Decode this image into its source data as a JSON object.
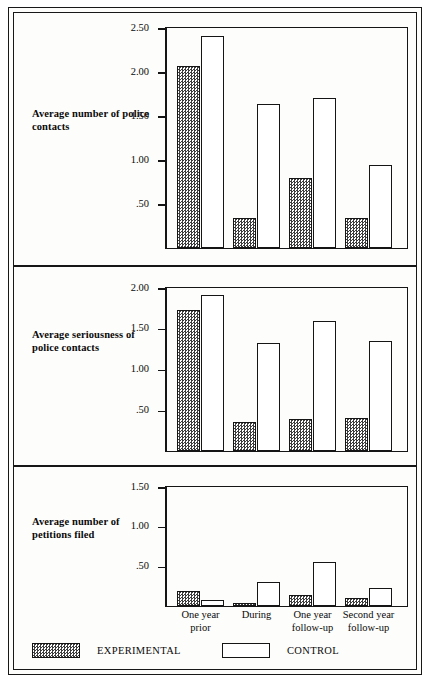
{
  "chart_data": [
    {
      "type": "bar",
      "title": "",
      "panel_label": "Average\nnumber of\npolice  contacts",
      "ylabel": "Average number of police contacts",
      "xlabel": "",
      "categories": [
        "One year\nprior",
        "During",
        "One year\nfollow-up",
        "Second year\nfollow-up"
      ],
      "ytick_labels": [
        "2.50",
        "2.00",
        "1.50",
        "1.00",
        ".50"
      ],
      "ytick_values": [
        2.5,
        2.0,
        1.5,
        1.0,
        0.5
      ],
      "ylim": [
        0,
        2.5
      ],
      "grid": false,
      "legend_position": "bottom",
      "series": [
        {
          "name": "EXPERIMENTAL",
          "values": [
            2.06,
            0.33,
            0.79,
            0.33
          ]
        },
        {
          "name": "CONTROL",
          "values": [
            2.4,
            1.63,
            1.7,
            0.94
          ]
        }
      ]
    },
    {
      "type": "bar",
      "title": "",
      "panel_label": "Average\nseriousness\nof police\ncontacts",
      "ylabel": "Average seriousness of police contacts",
      "xlabel": "",
      "categories": [
        "One year\nprior",
        "During",
        "One year\nfollow-up",
        "Second year\nfollow-up"
      ],
      "ytick_labels": [
        "2.00",
        "1.50",
        "1.00",
        ".50"
      ],
      "ytick_values": [
        2.0,
        1.5,
        1.0,
        0.5
      ],
      "ylim": [
        0,
        2.0
      ],
      "grid": false,
      "legend_position": "bottom",
      "series": [
        {
          "name": "EXPERIMENTAL",
          "values": [
            1.72,
            0.35,
            0.38,
            0.4
          ]
        },
        {
          "name": "CONTROL",
          "values": [
            1.9,
            1.31,
            1.59,
            1.34
          ]
        }
      ]
    },
    {
      "type": "bar",
      "title": "",
      "panel_label": "Average\nnumber of\npetitions\nfiled",
      "ylabel": "Average number of petitions filed",
      "xlabel": "",
      "categories": [
        "One year\nprior",
        "During",
        "One year\nfollow-up",
        "Second year\nfollow-up"
      ],
      "ytick_labels": [
        "1.50",
        "1.00",
        ".50"
      ],
      "ytick_values": [
        1.5,
        1.0,
        0.5
      ],
      "ylim": [
        0,
        1.5
      ],
      "grid": false,
      "legend_position": "bottom",
      "series": [
        {
          "name": "EXPERIMENTAL",
          "values": [
            0.18,
            0.03,
            0.13,
            0.1
          ]
        },
        {
          "name": "CONTROL",
          "values": [
            0.07,
            0.3,
            0.54,
            0.22
          ]
        }
      ]
    }
  ],
  "panels": [
    {
      "label": "Average\nnumber of\npolice  contacts"
    },
    {
      "label": "Average\nseriousness\nof police\ncontacts"
    },
    {
      "label": "Average\nnumber of\npetitions\nfiled"
    }
  ],
  "axis": {
    "categories": [
      "One year\nprior",
      "During",
      "One year\nfollow-up",
      "Second year\nfollow-up"
    ]
  },
  "legend": {
    "items": [
      {
        "label": "EXPERIMENTAL",
        "fill": "hatched",
        "color": "#3d3d3d"
      },
      {
        "label": "CONTROL",
        "fill": "solid",
        "color": "#ffffff"
      }
    ]
  },
  "colors": {
    "ink": "#151515",
    "paper": "#fdfdfb",
    "experimental_fill": "#3d3d3d",
    "control_fill": "#ffffff"
  }
}
